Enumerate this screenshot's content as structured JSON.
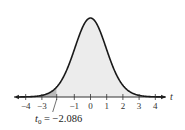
{
  "chart_data": {
    "type": "area",
    "title": "",
    "xlabel": "t",
    "ylabel": "",
    "xlim": [
      -4.6,
      4.6
    ],
    "x_ticks": [
      -4,
      -3,
      -1,
      0,
      1,
      2,
      3,
      4
    ],
    "x_tick_labels": [
      "−4",
      "−3",
      "−1",
      "0",
      "1",
      "2",
      "3",
      "4"
    ],
    "grid": false,
    "legend": null,
    "curve": "t-distribution density (bell curve) centered at 0",
    "shaded_regions": [
      {
        "name": "left-tail",
        "from": -4.6,
        "to": -2.086,
        "color": "#b9b9b9"
      },
      {
        "name": "body",
        "from": -2.086,
        "to": 4.6,
        "color": "#ececec"
      }
    ],
    "annotation": {
      "symbol": "t",
      "subscript": "0",
      "value": "−2.086",
      "x": -2.086
    }
  },
  "colors": {
    "curve": "#1a1a1a",
    "axis": "#333333",
    "tail_fill": "#b9b9b9",
    "body_fill": "#ececec"
  }
}
